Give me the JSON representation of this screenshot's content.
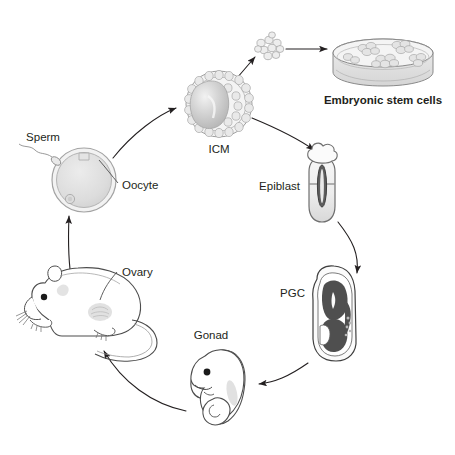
{
  "figure": {
    "background_color": "#ffffff",
    "line_color": "#231f20",
    "width": 455,
    "height": 455
  },
  "labels": {
    "icm": "ICM",
    "embryonic_stem_cells": "Embryonic stem cells",
    "epiblast": "Epiblast",
    "pgc": "PGC",
    "gonad": "Gonad",
    "ovary": "Ovary",
    "sperm": "Sperm",
    "oocyte": "Oocyte"
  },
  "nodes": [
    {
      "id": "icm",
      "label": "ICM",
      "description": "Blastocyst with inner cell mass",
      "cx": 219,
      "cy": 104,
      "r": 33,
      "fill": "#d9d9d9",
      "stroke": "#8c8c8c"
    },
    {
      "id": "es-colony",
      "label": "",
      "description": "Dissociated inner cell mass clump",
      "cx": 268,
      "cy": 46,
      "fill": "#e6e6e6",
      "stroke": "#9a9a9a"
    },
    {
      "id": "es-dish",
      "label": "Embryonic stem cells",
      "description": "Petri dish with embryonic stem cell colonies",
      "cx": 377,
      "cy": 56,
      "fill": "#e8e8e8",
      "stroke": "#8c8c8c"
    },
    {
      "id": "epiblast",
      "label": "Epiblast",
      "description": "Egg cylinder stage embryo",
      "cx": 322,
      "cy": 183,
      "fill": "#e3e3e3",
      "stroke": "#7a7a7a"
    },
    {
      "id": "pgc",
      "label": "PGC",
      "description": "Primordial germ cells in post-implantation embryo",
      "cx": 333,
      "cy": 313,
      "fill": "#595959",
      "stroke": "#333333"
    },
    {
      "id": "gonad",
      "label": "Gonad",
      "description": "Mid-gestation embryo with developing gonad",
      "cx": 222,
      "cy": 388,
      "fill": "#ffffff",
      "stroke": "#4d4d4d"
    },
    {
      "id": "mouse",
      "label": "Ovary",
      "description": "Adult mouse with ovary",
      "cx": 92,
      "cy": 310,
      "fill": "#ffffff",
      "stroke": "#4d4d4d"
    },
    {
      "id": "oocyte",
      "label": "Oocyte",
      "description": "Oocyte fertilised by sperm",
      "cx": 84,
      "cy": 180,
      "r": 33,
      "fill": "#dedede",
      "stroke": "#9a9a9a"
    },
    {
      "id": "sperm",
      "label": "Sperm",
      "description": "Spermatozoon approaching oocyte",
      "cx": 42,
      "cy": 158,
      "fill": "#e6e6e6",
      "stroke": "#8c8c8c"
    }
  ],
  "arrows": [
    {
      "id": "oocyte-to-icm",
      "from": "oocyte",
      "to": "icm",
      "style": "curved"
    },
    {
      "id": "icm-to-clump",
      "from": "icm",
      "to": "es-colony",
      "style": "straight"
    },
    {
      "id": "clump-to-dish",
      "from": "es-colony",
      "to": "es-dish",
      "style": "straight"
    },
    {
      "id": "icm-to-epiblast",
      "from": "icm",
      "to": "epiblast",
      "style": "curved"
    },
    {
      "id": "epiblast-to-pgc",
      "from": "epiblast",
      "to": "pgc",
      "style": "curved"
    },
    {
      "id": "pgc-to-gonad",
      "from": "pgc",
      "to": "gonad",
      "style": "curved"
    },
    {
      "id": "gonad-to-mouse",
      "from": "gonad",
      "to": "mouse",
      "style": "curved"
    },
    {
      "id": "mouse-to-oocyte",
      "from": "mouse",
      "to": "oocyte",
      "style": "curved"
    }
  ]
}
